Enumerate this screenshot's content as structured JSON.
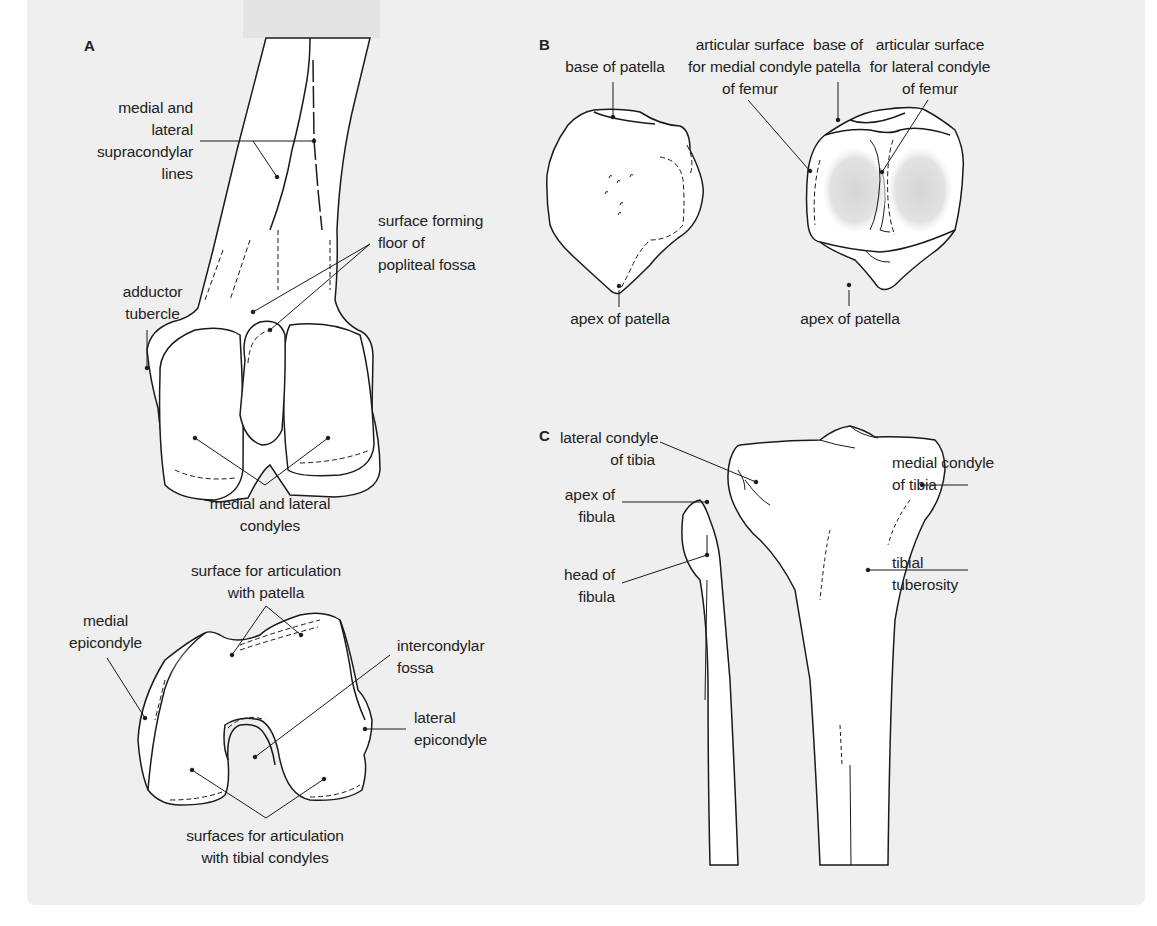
{
  "figure": {
    "panels": [
      {
        "letter": "A",
        "title": "Distal femur (posterior and inferior views)",
        "labels": {
          "supracondylar": [
            "medial and",
            "lateral",
            "supracondylar",
            "lines"
          ],
          "popliteal": [
            "surface forming",
            "floor of",
            "popliteal fossa"
          ],
          "adductor": [
            "adductor",
            "tubercle"
          ],
          "condyles": [
            "medial and lateral",
            "condyles"
          ],
          "patellar_surface": [
            "surface for articulation",
            "with patella"
          ],
          "medial_epicondyle": [
            "medial",
            "epicondyle"
          ],
          "intercondylar": [
            "intercondylar",
            "fossa"
          ],
          "lateral_epicondyle": [
            "lateral",
            "epicondyle"
          ],
          "tibial_surfaces": [
            "surfaces for articulation",
            "with tibial condyles"
          ]
        }
      },
      {
        "letter": "B",
        "title": "Patella (anterior and posterior views)",
        "labels": {
          "base_left": [
            "base of patella"
          ],
          "apex_left": [
            "apex of patella"
          ],
          "medial_art": [
            "articular surface",
            "for medial condyle",
            "of femur"
          ],
          "base_right": [
            "base of",
            "patella"
          ],
          "lateral_art": [
            "articular surface",
            "for lateral condyle",
            "of femur"
          ],
          "apex_right": [
            "apex of patella"
          ]
        }
      },
      {
        "letter": "C",
        "title": "Proximal tibia and fibula (anterior view)",
        "labels": {
          "lateral_condyle": [
            "lateral condyle",
            "of tibia"
          ],
          "medial_condyle": [
            "medial condyle",
            "of tibia"
          ],
          "apex_fibula": [
            "apex of",
            "fibula"
          ],
          "head_fibula": [
            "head of",
            "fibula"
          ],
          "tuberosity": [
            "tibial",
            "tuberosity"
          ]
        }
      }
    ],
    "colors": {
      "background": "#efefef",
      "bone": "#ffffff",
      "outline": "#1a1a1a",
      "articular_shade": "#d9d9d9"
    }
  }
}
